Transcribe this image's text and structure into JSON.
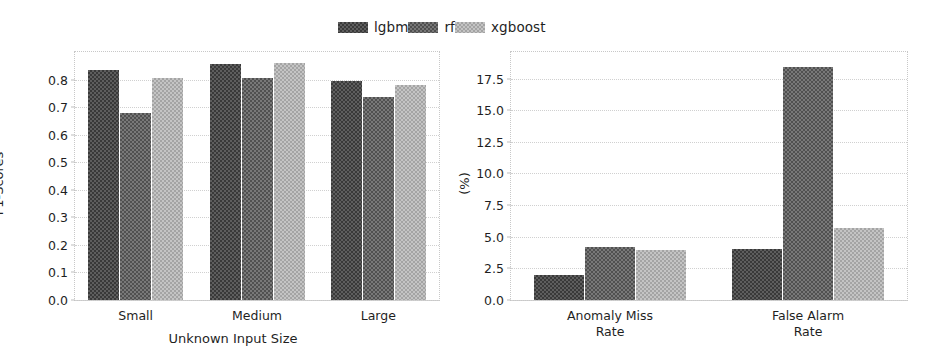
{
  "legend": {
    "position": "upper-center",
    "entries": [
      {
        "label": "lgbm",
        "color": "#5e5e5e",
        "swatch": "hatch-dark"
      },
      {
        "label": "rf",
        "color": "#787878",
        "swatch": "hatch-medium"
      },
      {
        "label": "xgboost",
        "color": "#c4c4c4",
        "swatch": "hatch-light"
      }
    ]
  },
  "chart_data": [
    {
      "type": "bar",
      "id": "f1-scores",
      "title": "",
      "xlabel": "Unknown Input Size",
      "ylabel": "F1-Scores",
      "categories": [
        "Small",
        "Medium",
        "Large"
      ],
      "series": [
        {
          "name": "lgbm",
          "values": [
            0.835,
            0.855,
            0.795
          ]
        },
        {
          "name": "rf",
          "values": [
            0.68,
            0.805,
            0.735
          ]
        },
        {
          "name": "xgboost",
          "values": [
            0.805,
            0.86,
            0.78
          ]
        }
      ],
      "ylim": [
        0.0,
        0.9
      ],
      "yticks": [
        0.0,
        0.1,
        0.2,
        0.3,
        0.4,
        0.5,
        0.6,
        0.7,
        0.8
      ],
      "ytick_labels": [
        "0.0",
        "0.1",
        "0.2",
        "0.3",
        "0.4",
        "0.5",
        "0.6",
        "0.7",
        "0.8"
      ],
      "grid": true,
      "grid_axis": "y"
    },
    {
      "type": "bar",
      "id": "error-rates",
      "title": "",
      "xlabel": "",
      "ylabel": "(%)",
      "categories": [
        "Anomaly Miss\nRate",
        "False Alarm\nRate"
      ],
      "series": [
        {
          "name": "lgbm",
          "values": [
            2.0,
            4.0
          ]
        },
        {
          "name": "rf",
          "values": [
            4.2,
            18.4
          ]
        },
        {
          "name": "xgboost",
          "values": [
            3.95,
            5.7
          ]
        }
      ],
      "ylim": [
        0.0,
        19.6
      ],
      "yticks": [
        0.0,
        2.5,
        5.0,
        7.5,
        10.0,
        12.5,
        15.0,
        17.5
      ],
      "ytick_labels": [
        "0.0",
        "2.5",
        "5.0",
        "7.5",
        "10.0",
        "12.5",
        "15.0",
        "17.5"
      ],
      "grid": true,
      "grid_axis": "y"
    }
  ]
}
